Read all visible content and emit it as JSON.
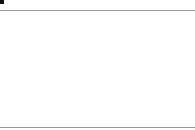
{
  "figure": {
    "type": "function-graph",
    "grid_step_units": 0.5,
    "axes": {
      "x_label": "x",
      "y_label": "y",
      "x_range": [
        -1,
        7
      ],
      "y_range": [
        -1,
        4
      ]
    },
    "x_ticks": [
      "0",
      "1",
      "2",
      "3",
      "4",
      "5",
      "6"
    ],
    "y_ticks": [
      "1",
      "2",
      "3"
    ],
    "curve": {
      "label_main": "K",
      "label_sub": "f",
      "color": "#333333"
    },
    "points": {
      "A": {
        "label": "A(0|0)",
        "label_parts": [
          "A(",
          "0",
          "|0)"
        ],
        "x": 0,
        "y": 0
      },
      "B": {
        "label": "B(u|0)",
        "label_parts": [
          "B(",
          "u",
          "|0)"
        ],
        "x": 3.6,
        "y": 0
      },
      "C": {
        "label": "C(u|f(u))",
        "label_parts": [
          "C(",
          "u",
          "| ",
          "f",
          "(",
          "u",
          "))"
        ],
        "x": 3.6,
        "y": 2.3
      }
    },
    "shaded_region": {
      "vertices": [
        "A",
        "B",
        "C"
      ],
      "fill": "#d9d9d9",
      "pattern": "vertical-hatch"
    },
    "colors": {
      "grid": "#c8c8c8",
      "axis": "#333333",
      "frame": "#9a9a9a",
      "point": "#111111"
    }
  }
}
